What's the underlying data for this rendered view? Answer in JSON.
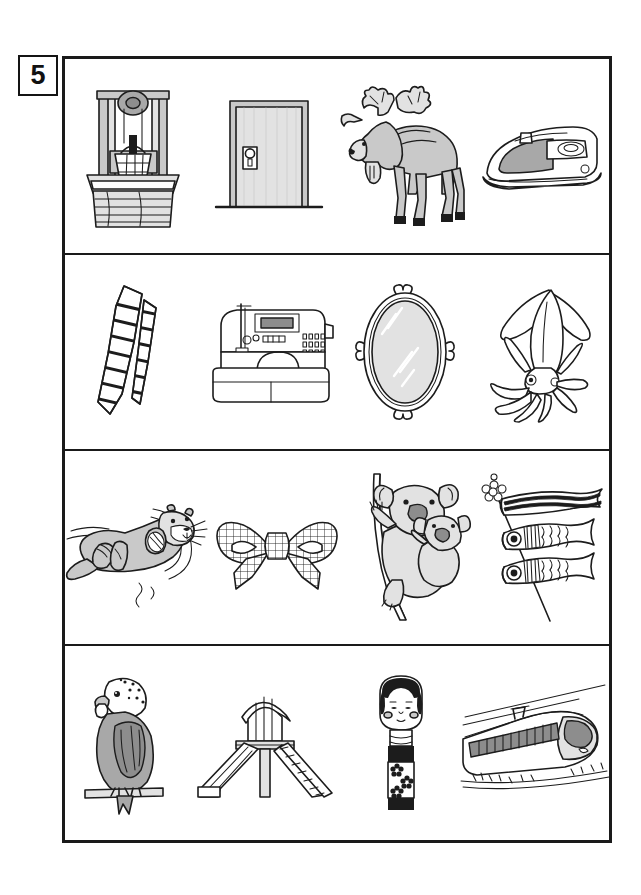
{
  "page": {
    "number": "5",
    "background_color": "#ffffff",
    "frame_color": "#1a1a1a"
  },
  "worksheet": {
    "columns": 4,
    "rows": [
      {
        "row_index": 1,
        "items": [
          {
            "slot": 1,
            "name": "well",
            "label": "well with bucket and pulley",
            "icon": "well-icon"
          },
          {
            "slot": 2,
            "name": "door",
            "label": "door",
            "icon": "door-icon"
          },
          {
            "slot": 3,
            "name": "moose",
            "label": "moose",
            "icon": "moose-icon"
          },
          {
            "slot": 4,
            "name": "iron",
            "label": "clothes iron",
            "icon": "iron-icon"
          }
        ]
      },
      {
        "row_index": 2,
        "items": [
          {
            "slot": 1,
            "name": "necktie",
            "label": "striped necktie",
            "icon": "necktie-icon"
          },
          {
            "slot": 2,
            "name": "sewing-machine",
            "label": "sewing machine",
            "icon": "sewing-machine-icon"
          },
          {
            "slot": 3,
            "name": "mirror",
            "label": "oval hand mirror",
            "icon": "mirror-icon"
          },
          {
            "slot": 4,
            "name": "squid",
            "label": "squid",
            "icon": "squid-icon"
          }
        ]
      },
      {
        "row_index": 3,
        "items": [
          {
            "slot": 1,
            "name": "sea-otter",
            "label": "sea otter floating",
            "icon": "sea-otter-icon"
          },
          {
            "slot": 2,
            "name": "ribbon-bow",
            "label": "checkered ribbon bow",
            "icon": "ribbon-bow-icon"
          },
          {
            "slot": 3,
            "name": "koala",
            "label": "koala with baby",
            "icon": "koala-icon"
          },
          {
            "slot": 4,
            "name": "koinobori",
            "label": "carp streamers",
            "icon": "koinobori-icon"
          }
        ]
      },
      {
        "row_index": 4,
        "items": [
          {
            "slot": 1,
            "name": "budgerigar",
            "label": "budgerigar",
            "icon": "budgerigar-icon"
          },
          {
            "slot": 2,
            "name": "slide",
            "label": "playground slide",
            "icon": "slide-icon"
          },
          {
            "slot": 3,
            "name": "kokeshi-doll",
            "label": "kokeshi doll",
            "icon": "kokeshi-doll-icon"
          },
          {
            "slot": 4,
            "name": "bullet-train",
            "label": "bullet train",
            "icon": "bullet-train-icon"
          }
        ]
      }
    ]
  },
  "palette": {
    "ink": "#1c1c1c",
    "paper": "#ffffff",
    "shade_light": "#e2e2e2",
    "shade_mid": "#c9c9c9",
    "shade_dark": "#a8a8a8",
    "shade_darker": "#8d8d8d"
  }
}
